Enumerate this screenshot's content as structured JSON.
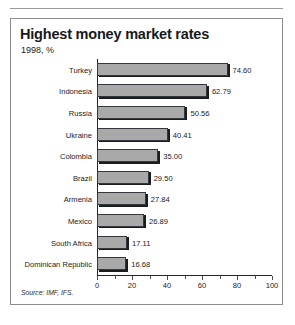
{
  "figure": {
    "title": "Highest money market rates",
    "subtitle": "1998, %",
    "source": "Source: IMF, IFS."
  },
  "chart_data": {
    "type": "bar",
    "orientation": "horizontal",
    "title": "Highest money market rates",
    "subtitle": "1998, %",
    "xlabel": "",
    "ylabel": "",
    "xlim": [
      0,
      100
    ],
    "xticks": [
      0,
      20,
      40,
      60,
      80,
      100
    ],
    "xtick_labels": [
      "0",
      "20",
      "40",
      "60",
      "80",
      "100"
    ],
    "minor_tick_step": 10,
    "grid": false,
    "legend": false,
    "value_labels": true,
    "bar_color": "#a9a9a9",
    "bar_edge_color": "#34383c",
    "shadow_color": "#1a1d20",
    "categories": [
      "Turkey",
      "Indonesia",
      "Russia",
      "Ukraine",
      "Colombia",
      "Brazil",
      "Armenia",
      "Mexico",
      "South Africa",
      "Dominican Republic"
    ],
    "values": [
      74.6,
      62.79,
      50.56,
      40.41,
      35.0,
      29.5,
      27.84,
      26.89,
      17.11,
      16.68
    ],
    "value_labels_text": [
      "74.60",
      "62.79",
      "50.56",
      "40.41",
      "35.00",
      "29.50",
      "27.84",
      "26.89",
      "17.11",
      "16.68"
    ],
    "source": "Source: IMF, IFS."
  }
}
